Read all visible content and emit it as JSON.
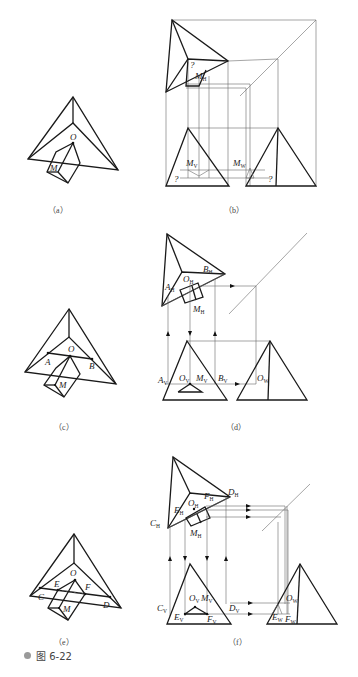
{
  "figure": {
    "caption": "图 6-22",
    "bullet_color": "#9a9a9a"
  },
  "panels": [
    {
      "id": "a",
      "caption": "（a）",
      "labels": {
        "O": "O",
        "M": "M"
      }
    },
    {
      "id": "b",
      "caption": "（b）",
      "labels": {
        "MH": "M",
        "MH_sub": "H",
        "MV": "M",
        "MV_sub": "V",
        "MW": "M",
        "MW_sub": "W",
        "q": "?"
      }
    },
    {
      "id": "c",
      "caption": "（c）",
      "labels": {
        "O": "O",
        "A": "A",
        "B": "B",
        "M": "M"
      }
    },
    {
      "id": "d",
      "caption": "（d）",
      "labels": {
        "AH": "A",
        "BH": "B",
        "OH": "O",
        "MH": "M",
        "AV": "A",
        "OV": "O",
        "MV": "M",
        "BV": "B",
        "OW": "O",
        "H": "H",
        "V": "V",
        "W": "W"
      }
    },
    {
      "id": "e",
      "caption": "（e）",
      "labels": {
        "O": "O",
        "E": "E",
        "F": "F",
        "C": "C",
        "D": "D",
        "M": "M"
      }
    },
    {
      "id": "f",
      "caption": "（f）",
      "labels": {
        "CH": "C",
        "EH": "E",
        "OH": "O",
        "FH": "F",
        "DH": "D",
        "MH": "M",
        "CV": "C",
        "EV": "E",
        "OV": "O",
        "MV": "M",
        "FV": "F",
        "DV": "D",
        "OW": "O",
        "EW": "E",
        "FW": "F",
        "H": "H",
        "V": "V",
        "W": "W"
      }
    }
  ]
}
